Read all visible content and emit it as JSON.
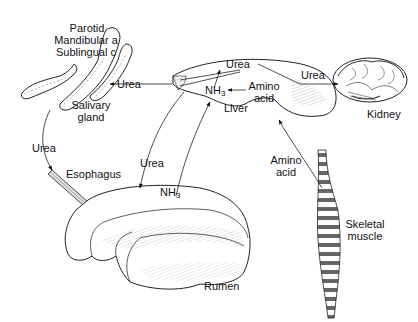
{
  "figure": {
    "type": "anatomical-flow-diagram",
    "topic": "Urea recycling in ruminants"
  },
  "organs": {
    "salivary_gland": {
      "label_line1": "Salivary",
      "label_line2": "gland"
    },
    "salivary_subtypes": [
      "Parotid",
      "Mandibular a",
      "Sublingual c"
    ],
    "liver": {
      "label": "Liver"
    },
    "kidney": {
      "label": "Kidney"
    },
    "esophagus": {
      "label": "Esophagus"
    },
    "rumen": {
      "label": "Rumen"
    },
    "skeletal_muscle": {
      "label_line1": "Skeletal",
      "label_line2": "muscle"
    }
  },
  "substances": {
    "urea_liver": "Urea",
    "nh3_liver": "NH",
    "nh3_liver_sub": "3",
    "amino_acid_liver_line1": "Amino",
    "amino_acid_liver_line2": "acid",
    "urea_to_salivary": "Urea",
    "urea_to_kidney": "Urea",
    "urea_to_rumen": "Urea",
    "urea_saliva_to_esophagus": "Urea",
    "nh3_rumen": "NH",
    "nh3_rumen_sub": "3",
    "amino_acid_muscle_line1": "Amino",
    "amino_acid_muscle_line2": "acid"
  },
  "flows": [
    {
      "from": "Liver",
      "to": "Salivary gland",
      "substance": "Urea"
    },
    {
      "from": "Liver",
      "to": "Kidney",
      "substance": "Urea"
    },
    {
      "from": "Liver",
      "to": "Rumen",
      "substance": "Urea"
    },
    {
      "from": "Salivary gland",
      "to": "Esophagus",
      "substance": "Urea"
    },
    {
      "from": "Rumen",
      "to": "Liver",
      "substance": "NH3"
    },
    {
      "from": "Skeletal muscle",
      "to": "Liver",
      "substance": "Amino acid"
    },
    {
      "from": "Amino acid",
      "to": "NH3",
      "substance": "",
      "location": "Liver"
    },
    {
      "from": "NH3",
      "to": "Urea",
      "substance": "",
      "location": "Liver"
    }
  ]
}
